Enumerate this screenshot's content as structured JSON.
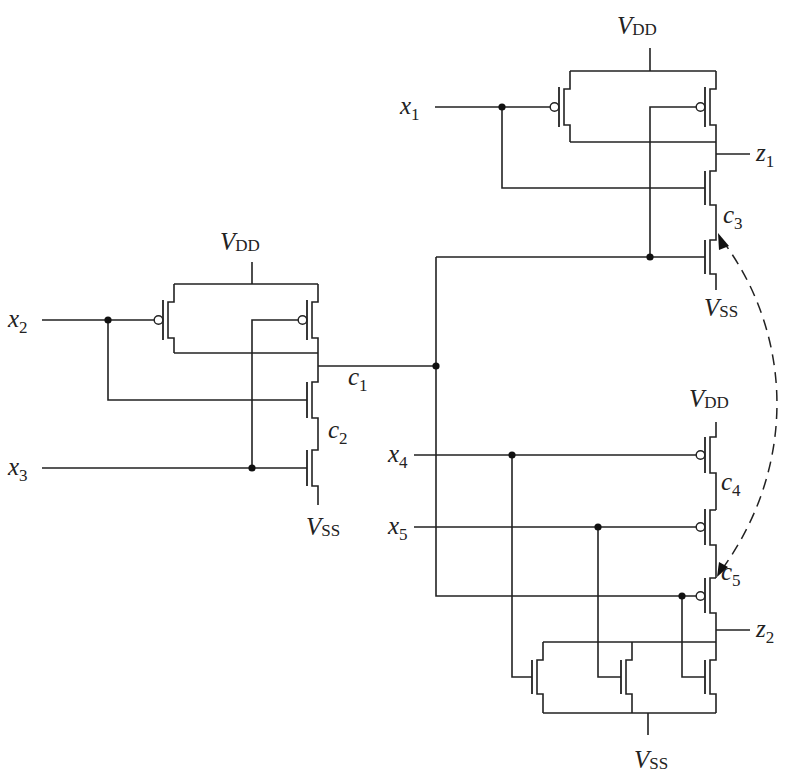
{
  "diagram": {
    "type": "CMOS transistor-level circuit schematic",
    "labels": {
      "vdd_main": "V",
      "vdd_sub": "DD",
      "vss_main": "V",
      "vss_sub": "SS",
      "x1": "x",
      "x1_sub": "1",
      "x2": "x",
      "x2_sub": "2",
      "x3": "x",
      "x3_sub": "3",
      "x4": "x",
      "x4_sub": "4",
      "x5": "x",
      "x5_sub": "5",
      "z1": "z",
      "z1_sub": "1",
      "z2": "z",
      "z2_sub": "2",
      "c1": "c",
      "c1_sub": "1",
      "c2": "c",
      "c2_sub": "2",
      "c3": "c",
      "c3_sub": "3",
      "c4": "c",
      "c4_sub": "4",
      "c5": "c",
      "c5_sub": "5"
    },
    "gates": [
      {
        "name": "NAND2 (x2, x3) -> c1",
        "pmos": [
          "x2",
          "x3"
        ],
        "nmos_series": [
          "x2",
          "x3"
        ],
        "internal_node": "c2"
      },
      {
        "name": "NAND2 (x1, c1) -> z1",
        "pmos": [
          "x1",
          "c1"
        ],
        "nmos_series": [
          "x1",
          "c1"
        ],
        "internal_node": "c3"
      },
      {
        "name": "NOR3 (x4, x5, c1) -> z2",
        "pmos_series": [
          "x4",
          "x5",
          "c1"
        ],
        "nmos_parallel": [
          "x4",
          "x5",
          "c1"
        ],
        "internal_nodes": [
          "c4",
          "c5"
        ]
      }
    ],
    "annotation": "dashed curved double-headed arrow linking node c3 and node c5"
  }
}
